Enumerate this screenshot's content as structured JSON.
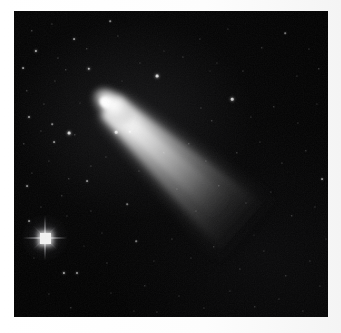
{
  "image": {
    "kind": "astrophotograph",
    "subject": "comet",
    "title": "Comet with bright coma and long dust tail over a star field",
    "orientation": "square",
    "border_color": "#ffffff",
    "sky_color": "#020202",
    "star_color": "#ffffff",
    "comet_color": "#f0f0f0",
    "frame": {
      "x": 14,
      "y": 11,
      "width": 314,
      "height": 306
    }
  },
  "comet": {
    "name": "comet",
    "coma_center": {
      "x": 96,
      "y": 95
    },
    "coma_radius_x": 20,
    "coma_radius_y": 13,
    "nucleus": {
      "x": 93,
      "y": 92,
      "radius": 6
    },
    "tail_angle_deg": 42,
    "tail_length": 190,
    "tail_start_width": 26,
    "tail_end_width": 56,
    "tail_end": {
      "x": 222,
      "y": 210
    },
    "brightness_peak": "#ffffff"
  },
  "bright_star": {
    "label": "foreground star with diffraction spikes",
    "x": 31,
    "y": 227,
    "spike_count": 4,
    "core_color": "#f2f2f2"
  },
  "stars": [
    {
      "x": 18,
      "y": 20,
      "r": 0.7,
      "o": 0.45
    },
    {
      "x": 38,
      "y": 13,
      "r": 0.6,
      "o": 0.35
    },
    {
      "x": 60,
      "y": 28,
      "r": 0.9,
      "o": 0.55
    },
    {
      "x": 22,
      "y": 40,
      "r": 1.1,
      "o": 0.7
    },
    {
      "x": 9,
      "y": 57,
      "r": 0.9,
      "o": 0.55
    },
    {
      "x": 44,
      "y": 47,
      "r": 0.6,
      "o": 0.35
    },
    {
      "x": 73,
      "y": 38,
      "r": 0.7,
      "o": 0.4
    },
    {
      "x": 96,
      "y": 10,
      "r": 0.8,
      "o": 0.5
    },
    {
      "x": 104,
      "y": 25,
      "r": 0.6,
      "o": 0.33
    },
    {
      "x": 75,
      "y": 58,
      "r": 1.2,
      "o": 0.72
    },
    {
      "x": 52,
      "y": 59,
      "r": 0.7,
      "o": 0.4
    },
    {
      "x": 41,
      "y": 70,
      "r": 0.6,
      "o": 0.32
    },
    {
      "x": 13,
      "y": 80,
      "r": 0.7,
      "o": 0.42
    },
    {
      "x": 30,
      "y": 93,
      "r": 0.6,
      "o": 0.32
    },
    {
      "x": 15,
      "y": 106,
      "r": 1.0,
      "o": 0.6
    },
    {
      "x": 38,
      "y": 113,
      "r": 0.8,
      "o": 0.48
    },
    {
      "x": 55,
      "y": 122,
      "r": 1.4,
      "o": 0.82
    },
    {
      "x": 40,
      "y": 131,
      "r": 0.9,
      "o": 0.52
    },
    {
      "x": 27,
      "y": 120,
      "r": 0.6,
      "o": 0.3
    },
    {
      "x": 61,
      "y": 124,
      "r": 0.7,
      "o": 0.4
    },
    {
      "x": 102,
      "y": 121,
      "r": 1.3,
      "o": 0.78
    },
    {
      "x": 116,
      "y": 121,
      "r": 1.2,
      "o": 0.74
    },
    {
      "x": 10,
      "y": 133,
      "r": 0.7,
      "o": 0.4
    },
    {
      "x": 35,
      "y": 150,
      "r": 0.6,
      "o": 0.3
    },
    {
      "x": 18,
      "y": 162,
      "r": 0.6,
      "o": 0.3
    },
    {
      "x": 55,
      "y": 168,
      "r": 0.7,
      "o": 0.38
    },
    {
      "x": 13,
      "y": 175,
      "r": 0.9,
      "o": 0.52
    },
    {
      "x": 77,
      "y": 155,
      "r": 0.6,
      "o": 0.32
    },
    {
      "x": 92,
      "y": 146,
      "r": 0.6,
      "o": 0.3
    },
    {
      "x": 27,
      "y": 196,
      "r": 0.6,
      "o": 0.32
    },
    {
      "x": 15,
      "y": 210,
      "r": 0.9,
      "o": 0.52
    },
    {
      "x": 48,
      "y": 185,
      "r": 0.7,
      "o": 0.36
    },
    {
      "x": 73,
      "y": 170,
      "r": 0.9,
      "o": 0.52
    },
    {
      "x": 53,
      "y": 205,
      "r": 0.6,
      "o": 0.28
    },
    {
      "x": 77,
      "y": 200,
      "r": 0.6,
      "o": 0.3
    },
    {
      "x": 50,
      "y": 262,
      "r": 1.1,
      "o": 0.66
    },
    {
      "x": 63,
      "y": 262,
      "r": 1.0,
      "o": 0.6
    },
    {
      "x": 35,
      "y": 283,
      "r": 0.6,
      "o": 0.3
    },
    {
      "x": 57,
      "y": 297,
      "r": 0.7,
      "o": 0.38
    },
    {
      "x": 20,
      "y": 247,
      "r": 0.6,
      "o": 0.28
    },
    {
      "x": 93,
      "y": 252,
      "r": 0.6,
      "o": 0.32
    },
    {
      "x": 122,
      "y": 230,
      "r": 0.8,
      "o": 0.46
    },
    {
      "x": 97,
      "y": 282,
      "r": 0.6,
      "o": 0.28
    },
    {
      "x": 131,
      "y": 275,
      "r": 0.7,
      "o": 0.36
    },
    {
      "x": 143,
      "y": 301,
      "r": 0.6,
      "o": 0.3
    },
    {
      "x": 113,
      "y": 193,
      "r": 0.8,
      "o": 0.44
    },
    {
      "x": 125,
      "y": 160,
      "r": 0.6,
      "o": 0.3
    },
    {
      "x": 150,
      "y": 142,
      "r": 0.7,
      "o": 0.36
    },
    {
      "x": 143,
      "y": 65,
      "r": 1.4,
      "o": 0.84
    },
    {
      "x": 126,
      "y": 52,
      "r": 0.6,
      "o": 0.3
    },
    {
      "x": 169,
      "y": 46,
      "r": 0.6,
      "o": 0.32
    },
    {
      "x": 186,
      "y": 28,
      "r": 0.6,
      "o": 0.3
    },
    {
      "x": 214,
      "y": 18,
      "r": 0.6,
      "o": 0.3
    },
    {
      "x": 203,
      "y": 52,
      "r": 0.6,
      "o": 0.28
    },
    {
      "x": 229,
      "y": 60,
      "r": 0.6,
      "o": 0.32
    },
    {
      "x": 248,
      "y": 37,
      "r": 0.7,
      "o": 0.36
    },
    {
      "x": 271,
      "y": 22,
      "r": 0.8,
      "o": 0.44
    },
    {
      "x": 295,
      "y": 38,
      "r": 0.6,
      "o": 0.3
    },
    {
      "x": 283,
      "y": 65,
      "r": 0.6,
      "o": 0.28
    },
    {
      "x": 305,
      "y": 58,
      "r": 0.7,
      "o": 0.38
    },
    {
      "x": 187,
      "y": 97,
      "r": 0.6,
      "o": 0.32
    },
    {
      "x": 198,
      "y": 110,
      "r": 0.7,
      "o": 0.38
    },
    {
      "x": 218,
      "y": 88,
      "r": 1.3,
      "o": 0.78
    },
    {
      "x": 237,
      "y": 106,
      "r": 0.6,
      "o": 0.3
    },
    {
      "x": 260,
      "y": 96,
      "r": 0.7,
      "o": 0.38
    },
    {
      "x": 284,
      "y": 112,
      "r": 0.6,
      "o": 0.3
    },
    {
      "x": 303,
      "y": 93,
      "r": 0.6,
      "o": 0.28
    },
    {
      "x": 175,
      "y": 133,
      "r": 0.7,
      "o": 0.36
    },
    {
      "x": 192,
      "y": 150,
      "r": 0.6,
      "o": 0.3
    },
    {
      "x": 223,
      "y": 142,
      "r": 0.7,
      "o": 0.38
    },
    {
      "x": 246,
      "y": 131,
      "r": 0.6,
      "o": 0.28
    },
    {
      "x": 268,
      "y": 152,
      "r": 0.6,
      "o": 0.3
    },
    {
      "x": 292,
      "y": 140,
      "r": 0.7,
      "o": 0.36
    },
    {
      "x": 308,
      "y": 168,
      "r": 0.9,
      "o": 0.52
    },
    {
      "x": 163,
      "y": 178,
      "r": 0.6,
      "o": 0.3
    },
    {
      "x": 182,
      "y": 200,
      "r": 0.6,
      "o": 0.28
    },
    {
      "x": 205,
      "y": 175,
      "r": 0.7,
      "o": 0.36
    },
    {
      "x": 232,
      "y": 192,
      "r": 0.6,
      "o": 0.3
    },
    {
      "x": 257,
      "y": 181,
      "r": 0.6,
      "o": 0.28
    },
    {
      "x": 278,
      "y": 205,
      "r": 0.7,
      "o": 0.38
    },
    {
      "x": 301,
      "y": 196,
      "r": 0.6,
      "o": 0.3
    },
    {
      "x": 158,
      "y": 228,
      "r": 0.6,
      "o": 0.3
    },
    {
      "x": 177,
      "y": 247,
      "r": 0.6,
      "o": 0.28
    },
    {
      "x": 200,
      "y": 236,
      "r": 0.7,
      "o": 0.36
    },
    {
      "x": 226,
      "y": 258,
      "r": 0.6,
      "o": 0.3
    },
    {
      "x": 250,
      "y": 240,
      "r": 0.6,
      "o": 0.28
    },
    {
      "x": 272,
      "y": 265,
      "r": 0.7,
      "o": 0.36
    },
    {
      "x": 296,
      "y": 250,
      "r": 0.6,
      "o": 0.3
    },
    {
      "x": 165,
      "y": 285,
      "r": 0.6,
      "o": 0.28
    },
    {
      "x": 190,
      "y": 297,
      "r": 0.6,
      "o": 0.3
    },
    {
      "x": 216,
      "y": 280,
      "r": 0.6,
      "o": 0.28
    },
    {
      "x": 241,
      "y": 296,
      "r": 0.7,
      "o": 0.36
    },
    {
      "x": 265,
      "y": 288,
      "r": 0.6,
      "o": 0.28
    },
    {
      "x": 289,
      "y": 300,
      "r": 0.6,
      "o": 0.3
    },
    {
      "x": 306,
      "y": 275,
      "r": 0.6,
      "o": 0.28
    },
    {
      "x": 140,
      "y": 250,
      "r": 0.6,
      "o": 0.26
    },
    {
      "x": 120,
      "y": 300,
      "r": 0.6,
      "o": 0.26
    },
    {
      "x": 88,
      "y": 222,
      "r": 0.6,
      "o": 0.26
    },
    {
      "x": 70,
      "y": 235,
      "r": 0.5,
      "o": 0.22
    },
    {
      "x": 150,
      "y": 40,
      "r": 0.5,
      "o": 0.24
    },
    {
      "x": 108,
      "y": 70,
      "r": 0.5,
      "o": 0.22
    },
    {
      "x": 66,
      "y": 92,
      "r": 0.5,
      "o": 0.24
    },
    {
      "x": 240,
      "y": 224,
      "r": 0.5,
      "o": 0.22
    },
    {
      "x": 196,
      "y": 60,
      "r": 0.5,
      "o": 0.22
    },
    {
      "x": 312,
      "y": 228,
      "r": 0.5,
      "o": 0.24
    }
  ]
}
